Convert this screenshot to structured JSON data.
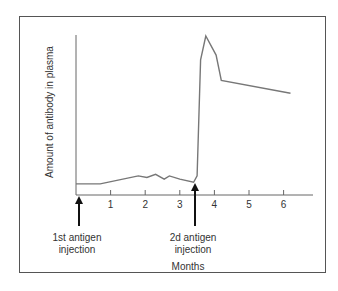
{
  "chart_data": {
    "type": "line",
    "title": "",
    "xlabel": "Months",
    "ylabel": "Amount of antibody in plasma",
    "x_ticks": [
      "1",
      "2",
      "3",
      "4",
      "5",
      "6"
    ],
    "xlim": [
      0,
      6.8
    ],
    "grid": false,
    "legend": null,
    "series": [
      {
        "name": "Antibody level",
        "x": [
          0,
          0.7,
          1.8,
          2.05,
          2.3,
          2.55,
          2.7,
          3.0,
          3.4,
          3.5,
          3.6,
          3.75,
          4.05,
          4.2,
          6.2
        ],
        "y": [
          7,
          7,
          12,
          11,
          13,
          10,
          12,
          10,
          8,
          12,
          85,
          100,
          88,
          72,
          64
        ]
      }
    ],
    "annotations": [
      {
        "x": 0.1,
        "text_line1": "1st antigen",
        "text_line2": "injection"
      },
      {
        "x": 3.45,
        "text_line1": "2d antigen",
        "text_line2": "injection"
      }
    ]
  },
  "labels": {
    "xlabel": "Months",
    "ylabel": "Amount of antibody in plasma",
    "tick1": "1",
    "tick2": "2",
    "tick3": "3",
    "tick4": "4",
    "tick5": "5",
    "tick6": "6",
    "ann1_l1": "1st antigen",
    "ann1_l2": "injection",
    "ann2_l1": "2d antigen",
    "ann2_l2": "injection"
  }
}
